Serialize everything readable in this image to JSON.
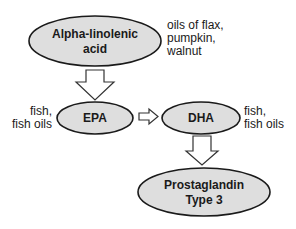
{
  "diagram": {
    "nodes": [
      {
        "id": "ala",
        "lines": [
          "Alpha-linolenic",
          "acid"
        ]
      },
      {
        "id": "epa",
        "lines": [
          "EPA"
        ]
      },
      {
        "id": "dha",
        "lines": [
          "DHA"
        ]
      },
      {
        "id": "pg3",
        "lines": [
          "Prostaglandin",
          "Type 3"
        ]
      }
    ],
    "annotations": {
      "ala_sources": [
        "oils of flax,",
        "pumpkin,",
        "walnut"
      ],
      "epa_sources": [
        "fish,",
        "fish oils"
      ],
      "dha_sources": [
        "fish,",
        "fish oils"
      ]
    },
    "edges": [
      {
        "from": "ala",
        "to": "epa",
        "direction": "down"
      },
      {
        "from": "epa",
        "to": "dha",
        "direction": "right"
      },
      {
        "from": "dha",
        "to": "pg3",
        "direction": "down"
      }
    ],
    "colors": {
      "node_fill": "#dedede",
      "node_stroke": "#1a1a1a",
      "arrow_fill": "#ffffff",
      "arrow_stroke": "#333333"
    }
  }
}
